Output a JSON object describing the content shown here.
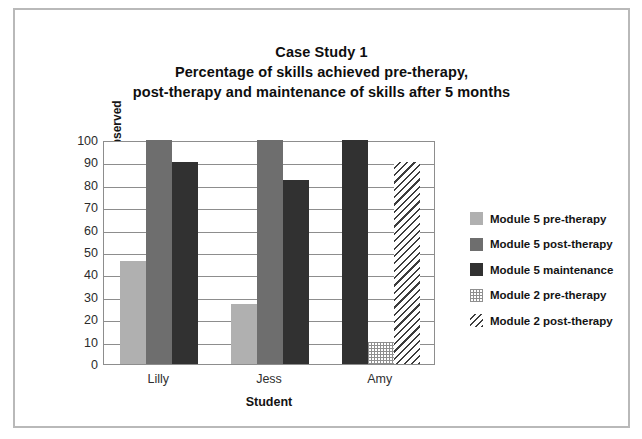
{
  "chart_data": {
    "type": "bar",
    "title": "Case Study 1\nPercentage of skills achieved pre-therapy,\npost-therapy and maintenance of skills after 5 months",
    "title_lines": [
      "Case Study 1",
      "Percentage of skills achieved pre-therapy,",
      "post-therapy and maintenance of skills after 5 months"
    ],
    "xlabel": "Student",
    "ylabel": "Percentage of skills observed",
    "categories": [
      "Lilly",
      "Jess",
      "Amy"
    ],
    "ylim": [
      0,
      100
    ],
    "ytick_labels": [
      "0",
      "10",
      "20",
      "30",
      "40",
      "50",
      "60",
      "70",
      "80",
      "90",
      "100"
    ],
    "ytick_values": [
      0,
      10,
      20,
      30,
      40,
      50,
      60,
      70,
      80,
      90,
      100
    ],
    "grid": true,
    "legend_position": "right",
    "series": [
      {
        "name": "Module 5 pre-therapy",
        "swatch": "sw-light",
        "color": "#b0b0b0",
        "values": [
          46,
          27,
          null
        ]
      },
      {
        "name": "Module 5 post-therapy",
        "swatch": "sw-medium",
        "color": "#6e6e6e",
        "values": [
          100,
          100,
          null
        ]
      },
      {
        "name": "Module 5 maintenance",
        "swatch": "sw-dark",
        "color": "#313131",
        "values": [
          90,
          82,
          100
        ]
      },
      {
        "name": "Module 2 pre-therapy",
        "swatch": "sw-dotted",
        "color": "#8f8f8f",
        "values": [
          null,
          null,
          10
        ]
      },
      {
        "name": "Module 2 post-therapy",
        "swatch": "sw-hatch",
        "color": "#3d3d3d",
        "values": [
          null,
          null,
          90
        ]
      }
    ]
  }
}
